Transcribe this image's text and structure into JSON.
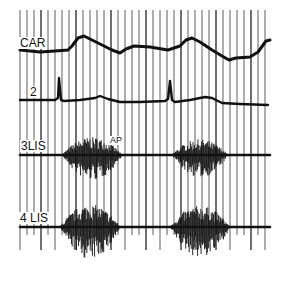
{
  "figure": {
    "background": "#ffffff",
    "ink": "#111111"
  },
  "labels": {
    "car": "CAR",
    "lead2": "2",
    "lis3": "3LIS",
    "lis4": "4 LIS",
    "ap": "AP"
  },
  "chart_data": {
    "type": "line",
    "title": "",
    "xlabel": "",
    "ylabel": "",
    "grid": "vertical timing lines only",
    "timing_lines_x_px": [
      20,
      27,
      34,
      41,
      48,
      55,
      62,
      69,
      76,
      83,
      90,
      97,
      104,
      111,
      118,
      125,
      132,
      139,
      146,
      153,
      160,
      167,
      174,
      181,
      188,
      195,
      202,
      209,
      216,
      223,
      230,
      237,
      244,
      251,
      258,
      265
    ],
    "series": [
      {
        "name": "CAR",
        "kind": "carotid pulse",
        "baseline_y_px": 50,
        "points": [
          [
            20,
            50
          ],
          [
            40,
            52
          ],
          [
            55,
            51
          ],
          [
            68,
            50
          ],
          [
            72,
            46
          ],
          [
            78,
            38
          ],
          [
            84,
            36
          ],
          [
            92,
            40
          ],
          [
            102,
            45
          ],
          [
            112,
            50
          ],
          [
            120,
            53
          ],
          [
            126,
            49
          ],
          [
            134,
            46
          ],
          [
            150,
            47
          ],
          [
            168,
            50
          ],
          [
            180,
            46
          ],
          [
            186,
            40
          ],
          [
            192,
            38
          ],
          [
            200,
            42
          ],
          [
            212,
            50
          ],
          [
            222,
            56
          ],
          [
            229,
            60
          ],
          [
            236,
            58
          ],
          [
            250,
            57
          ],
          [
            258,
            52
          ],
          [
            266,
            41
          ],
          [
            270,
            40
          ]
        ]
      },
      {
        "name": "2",
        "kind": "ECG lead II",
        "baseline_y_px": 100,
        "points": [
          [
            20,
            100
          ],
          [
            55,
            100
          ],
          [
            58,
            98
          ],
          [
            59,
            78
          ],
          [
            61,
            100
          ],
          [
            64,
            101
          ],
          [
            80,
            100
          ],
          [
            95,
            98
          ],
          [
            100,
            96
          ],
          [
            108,
            99
          ],
          [
            120,
            102
          ],
          [
            140,
            102
          ],
          [
            165,
            101
          ],
          [
            168,
            99
          ],
          [
            170,
            81
          ],
          [
            172,
            100
          ],
          [
            175,
            102
          ],
          [
            190,
            100
          ],
          [
            205,
            97
          ],
          [
            212,
            98
          ],
          [
            222,
            103
          ],
          [
            240,
            104
          ],
          [
            268,
            105
          ]
        ]
      },
      {
        "name": "3LIS",
        "kind": "phonocardiogram",
        "baseline_y_px": 155,
        "bursts": [
          {
            "x_start": 62,
            "x_end": 122,
            "peak_amp_px": 25
          },
          {
            "x_start": 172,
            "x_end": 228,
            "peak_amp_px": 22
          }
        ]
      },
      {
        "name": "4 LIS",
        "kind": "phonocardiogram",
        "baseline_y_px": 227,
        "bursts": [
          {
            "x_start": 60,
            "x_end": 120,
            "peak_amp_px": 32
          },
          {
            "x_start": 170,
            "x_end": 230,
            "peak_amp_px": 30
          }
        ]
      }
    ],
    "annotations": [
      {
        "text": "AP",
        "x_px": 113,
        "y_px": 140
      }
    ]
  }
}
